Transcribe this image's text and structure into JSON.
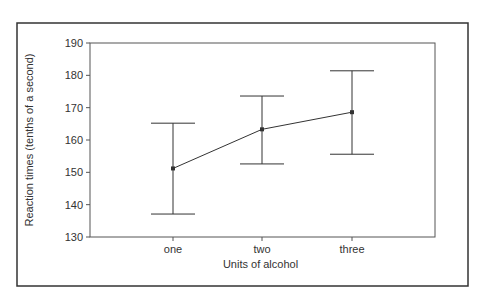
{
  "chart_data": {
    "type": "line",
    "subtype": "error_bar",
    "title": "",
    "xlabel": "Units of alcohol",
    "ylabel": "Reaction times (tenths of a second)",
    "categories": [
      "one",
      "two",
      "three"
    ],
    "series": [
      {
        "name": "Mean reaction time",
        "values": [
          151.2,
          163.3,
          168.6
        ],
        "error_upper": [
          165.2,
          173.6,
          181.4
        ],
        "error_lower": [
          137.1,
          152.6,
          155.6
        ]
      }
    ],
    "ylim": [
      130,
      190
    ],
    "yticks": [
      130,
      140,
      150,
      160,
      170,
      180,
      190
    ],
    "grid": false,
    "legend": null
  },
  "style": {
    "frame_color": "#333333",
    "axis_color": "#555555",
    "line_color": "#333333",
    "text_color": "#333333"
  },
  "layout": {
    "outer_frame": {
      "x": 17,
      "y": 23,
      "w": 451,
      "h": 263
    },
    "plot": {
      "x0": 90,
      "x1": 435,
      "y_top": 43,
      "y_bottom": 237
    },
    "x_positions": [
      173,
      262,
      352
    ],
    "cap_half_width": 22
  }
}
